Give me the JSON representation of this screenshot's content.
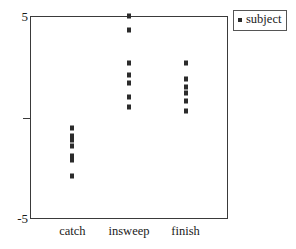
{
  "chart_data": {
    "type": "scatter",
    "title": "",
    "xlabel": "",
    "ylabel": "",
    "categories": [
      "catch",
      "insweep",
      "finish"
    ],
    "ylim": [
      -5,
      5
    ],
    "ytick_labels": [
      "5",
      "-5"
    ],
    "ytick_values": [
      5,
      -5
    ],
    "extra_ticks": [
      0
    ],
    "grid": false,
    "legend": {
      "position": "top-right",
      "entries": [
        {
          "label": "subject",
          "marker": "square",
          "color": "#2b2b2b"
        }
      ]
    },
    "series": [
      {
        "name": "subject",
        "marker": "square",
        "color": "#2b2b2b",
        "points": [
          {
            "category": "catch",
            "value": -0.5
          },
          {
            "category": "catch",
            "value": -0.9
          },
          {
            "category": "catch",
            "value": -1.1
          },
          {
            "category": "catch",
            "value": -1.4
          },
          {
            "category": "catch",
            "value": -1.9
          },
          {
            "category": "catch",
            "value": -2.1
          },
          {
            "category": "catch",
            "value": -2.9
          },
          {
            "category": "insweep",
            "value": 5.0
          },
          {
            "category": "insweep",
            "value": 4.3
          },
          {
            "category": "insweep",
            "value": 2.7
          },
          {
            "category": "insweep",
            "value": 2.1
          },
          {
            "category": "insweep",
            "value": 1.7
          },
          {
            "category": "insweep",
            "value": 1.0
          },
          {
            "category": "insweep",
            "value": 0.5
          },
          {
            "category": "finish",
            "value": 2.7
          },
          {
            "category": "finish",
            "value": 1.9
          },
          {
            "category": "finish",
            "value": 1.5
          },
          {
            "category": "finish",
            "value": 1.2
          },
          {
            "category": "finish",
            "value": 0.8
          },
          {
            "category": "finish",
            "value": 0.3
          }
        ]
      }
    ]
  }
}
